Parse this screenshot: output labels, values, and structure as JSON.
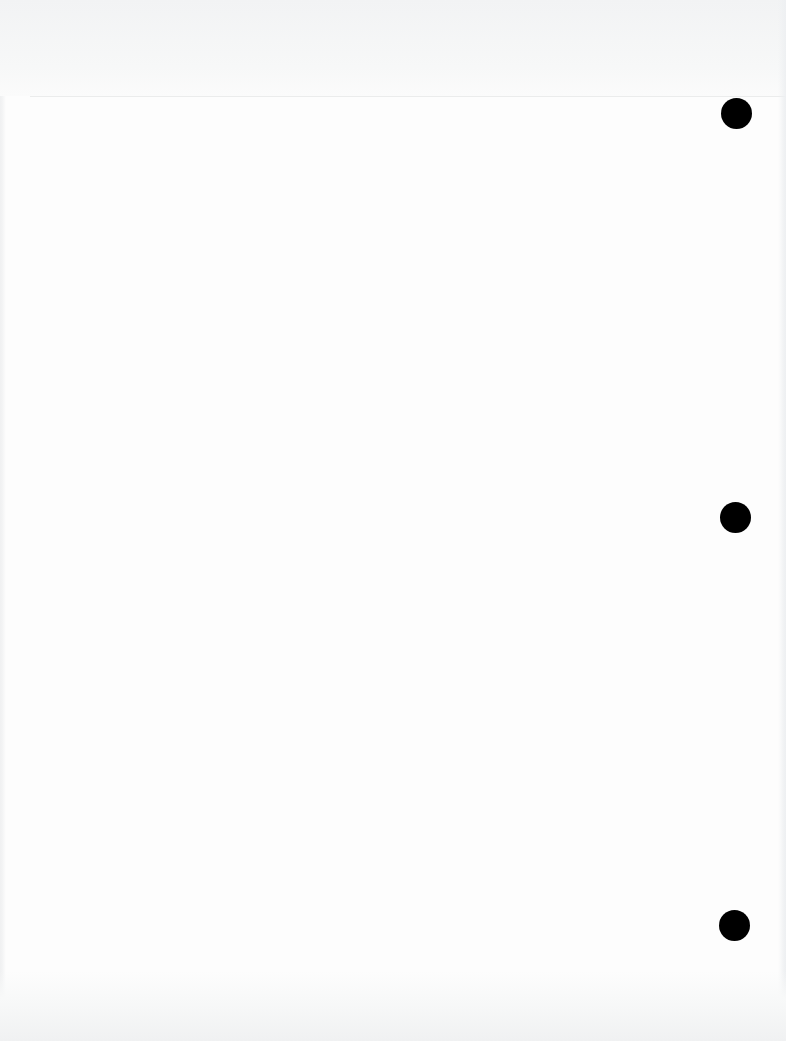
{
  "document": {
    "type": "blank scanned page",
    "background_color": "#fdfdfd",
    "hole_color": "#000000",
    "punch_holes": [
      {
        "position": "top",
        "cx": 737,
        "cy": 114,
        "diameter": 31
      },
      {
        "position": "middle",
        "cx": 736,
        "cy": 518,
        "diameter": 31
      },
      {
        "position": "bottom",
        "cx": 735,
        "cy": 926,
        "diameter": 31
      }
    ]
  }
}
